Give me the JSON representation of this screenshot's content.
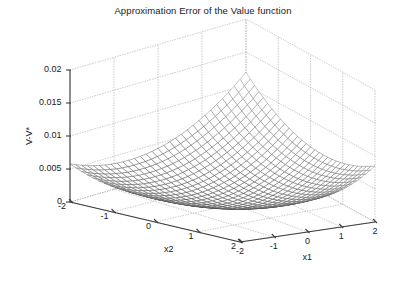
{
  "figure": {
    "title": "Approximation Error of the Value function",
    "background": "#ffffff",
    "foreground": "#1a1a1a"
  },
  "chart_data": {
    "type": "surface",
    "title": "Approximation Error of the Value function",
    "xlabel": "x1",
    "ylabel": "x2",
    "zlabel": "V-V*",
    "xlim": [
      -2,
      2
    ],
    "ylim": [
      -2,
      2
    ],
    "zlim": [
      0,
      0.02
    ],
    "xticks": [
      -2,
      -1,
      0,
      1,
      2
    ],
    "xticklabels": [
      "-2",
      "-1",
      "0",
      "1",
      "2"
    ],
    "yticks": [
      -2,
      -1,
      0,
      1,
      2
    ],
    "yticklabels": [
      "2",
      "1",
      "0",
      "-1",
      "-2"
    ],
    "zticks": [
      0,
      0.005,
      0.01,
      0.015,
      0.02
    ],
    "zticklabels": [
      "0",
      "0.005",
      "0.01",
      "0.015",
      "0.02"
    ],
    "grid": true,
    "legend": false,
    "mesh": {
      "nx": 31,
      "ny": 31,
      "line_color": "#404040",
      "face_color": "#ffffff"
    },
    "surface_model": {
      "description": "bowl-shaped quadratic approximation error surface, minimum near origin, rising toward corners",
      "z_expr": "a*(x+0.25)^2 + b*(y-0.15)^2 + c*(x+0.25)*(y-0.15) + z0",
      "a": 0.00115,
      "b": 0.00105,
      "c": 0.00052,
      "z0": 0.00035,
      "z_min": 0.00035,
      "z_max": 0.0205
    },
    "view": {
      "azimuth": -37.5,
      "elevation": 30
    },
    "corner_values": {
      "x1=-2,x2=2": 0.02,
      "x1=2,x2=2": 0.0093,
      "x1=-2,x2=-2": 0.009,
      "x1=2,x2=-2": 0.0178,
      "x1=0,x2=0": 0.0006
    }
  }
}
